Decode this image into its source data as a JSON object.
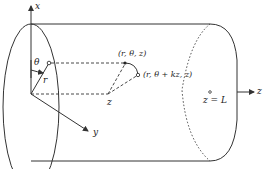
{
  "diagram": {
    "type": "cylinder-coordinate-figure",
    "axes": {
      "x": "x",
      "y": "y",
      "z": "z"
    },
    "labels": {
      "theta": "θ",
      "radius": "r",
      "point_original": "(r, θ, z)",
      "point_rotated": "(r, θ + kz, z)",
      "z_projection": "z",
      "end_label": "z = L"
    },
    "colors": {
      "stroke": "#333333",
      "background": "#ffffff"
    }
  }
}
